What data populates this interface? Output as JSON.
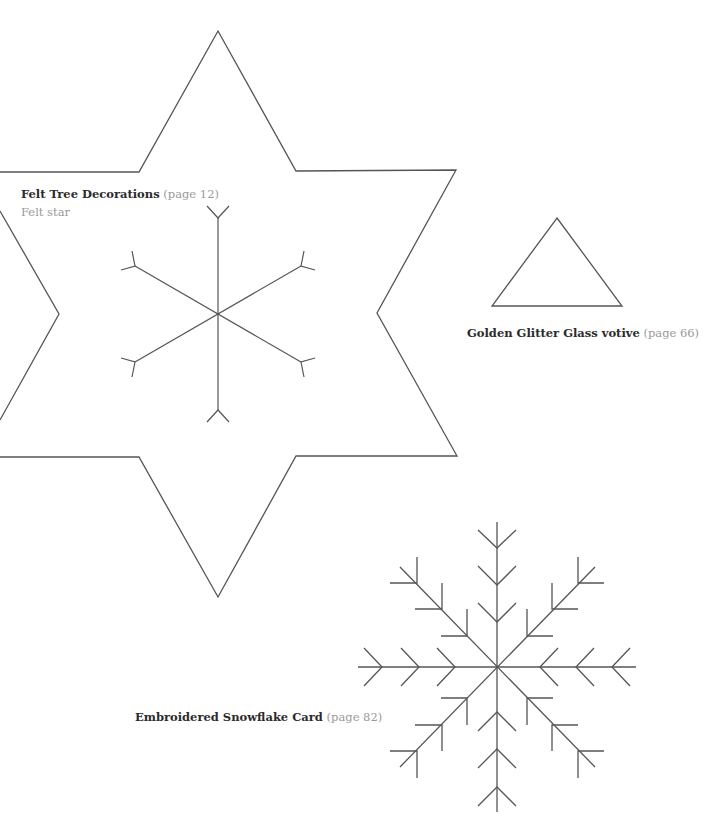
{
  "templates": [
    {
      "id": "felt-star",
      "title": "Felt Tree Decorations",
      "page_ref": "(page 12)",
      "subtitle": "Felt star",
      "shape": "six-point star with six-arm snowflake stitch guide"
    },
    {
      "id": "votive",
      "title": "Golden Glitter Glass votive",
      "page_ref": "(page 66)",
      "shape": "triangle"
    },
    {
      "id": "snowflake-card",
      "title": "Embroidered Snowflake Card",
      "page_ref": "(page 82)",
      "shape": "eight-arm branched snowflake"
    }
  ],
  "colors": {
    "line": "#555555",
    "title_text": "#2b2b2b",
    "page_ref_text": "#9a9a9a",
    "background": "#ffffff"
  }
}
